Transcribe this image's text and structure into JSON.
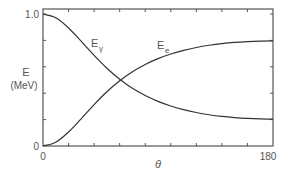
{
  "chart_data": {
    "type": "line",
    "title": "",
    "xlabel": "θ",
    "ylabel": "E",
    "ylabel_unit": "(MeV)",
    "xlim": [
      0,
      180
    ],
    "ylim": [
      0,
      1.0
    ],
    "x_tick_labels": [
      "0",
      "180"
    ],
    "y_tick_labels": [
      "0",
      "1.0"
    ],
    "x_minor_ticks": [
      20,
      40,
      60,
      80,
      100,
      120,
      140,
      160
    ],
    "y_minor_ticks": [
      0.2,
      0.4,
      0.6,
      0.8
    ],
    "grid": false,
    "legend": "inline",
    "x": [
      0,
      10,
      20,
      30,
      40,
      50,
      60,
      70,
      80,
      90,
      100,
      110,
      120,
      130,
      140,
      150,
      160,
      170,
      180
    ],
    "series": [
      {
        "name": "E_γ",
        "label_main": "E",
        "label_sub": "γ",
        "values": [
          1.0,
          0.971,
          0.894,
          0.792,
          0.686,
          0.589,
          0.506,
          0.437,
          0.382,
          0.338,
          0.303,
          0.276,
          0.254,
          0.237,
          0.224,
          0.215,
          0.209,
          0.205,
          0.203
        ]
      },
      {
        "name": "E_e",
        "label_main": "E",
        "label_sub": "e",
        "values": [
          0.0,
          0.029,
          0.106,
          0.208,
          0.314,
          0.411,
          0.494,
          0.563,
          0.618,
          0.662,
          0.697,
          0.724,
          0.746,
          0.763,
          0.776,
          0.785,
          0.791,
          0.795,
          0.797
        ]
      }
    ],
    "colors": {
      "axis": "#555555",
      "line": "#333333"
    }
  }
}
